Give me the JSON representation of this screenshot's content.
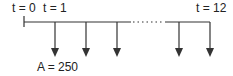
{
  "diagram": {
    "type": "cash-flow-timeline",
    "labels": {
      "start": "t = 0",
      "first": "t = 1",
      "end": "t = 12",
      "amount": "A = 250"
    },
    "periods": 12,
    "payment": 250,
    "line_color": "#333333"
  }
}
